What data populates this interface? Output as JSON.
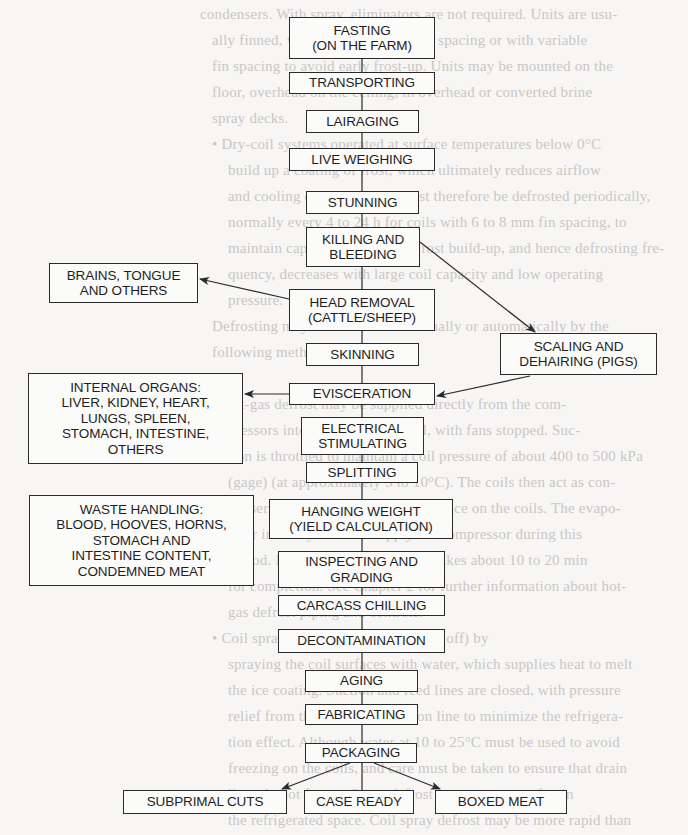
{
  "background_text": {
    "color": "#c9c7c4",
    "lines": [
      {
        "x": 200,
        "y": 6,
        "text": "condensers. With spray, eliminators are not required. Units are usu-"
      },
      {
        "x": 212,
        "y": 32,
        "text": "ally finned, with fins at about 6 mm spacing or with variable"
      },
      {
        "x": 212,
        "y": 58,
        "text": "fin spacing to avoid early frost-up. Units may be mounted on the"
      },
      {
        "x": 212,
        "y": 84,
        "text": "floor, overhead on the ceiling, in overhead or converted brine"
      },
      {
        "x": 212,
        "y": 110,
        "text": "spray decks."
      },
      {
        "x": 212,
        "y": 136,
        "text": "• Dry-coil systems operated at surface temperatures below 0°C"
      },
      {
        "x": 228,
        "y": 162,
        "text": "build up a coating of frost, which ultimately reduces airflow"
      },
      {
        "x": 228,
        "y": 188,
        "text": "and cooling capacity. Coils must therefore be defrosted periodically,"
      },
      {
        "x": 228,
        "y": 214,
        "text": "normally every 4 to 24 h for coils with 6 to 8 mm fin spacing, to"
      },
      {
        "x": 228,
        "y": 240,
        "text": "maintain capacity. The rate of frost build-up, and hence defrosting fre-"
      },
      {
        "x": 228,
        "y": 266,
        "text": "quency, decreases with large coil capacity and low operating"
      },
      {
        "x": 228,
        "y": 292,
        "text": "pressure."
      },
      {
        "x": 212,
        "y": 318,
        "text": "Defrosting may be done either manually or automatically by the"
      },
      {
        "x": 212,
        "y": 344,
        "text": "following methods:"
      },
      {
        "x": 212,
        "y": 396,
        "text": "• Hot-gas defrost may be supplied directly from the com-"
      },
      {
        "x": 228,
        "y": 422,
        "text": "pressors into the evaporator coil, with fans stopped. Suc-"
      },
      {
        "x": 228,
        "y": 448,
        "text": "tion is throttled to maintain a coil pressure of about 400 to 500 kPa"
      },
      {
        "x": 228,
        "y": 474,
        "text": "(gage) (at approximately 5 to 10°C). The coils then act as con-"
      },
      {
        "x": 228,
        "y": 500,
        "text": "densers and supply heat to melt the ice on the coils. The evapo-"
      },
      {
        "x": 228,
        "y": 526,
        "text": "rator in the system can supply the compressor during this"
      },
      {
        "x": 228,
        "y": 552,
        "text": "period. Hot-gas defrost normally takes about 10 to 20 min"
      },
      {
        "x": 228,
        "y": 578,
        "text": "for completion. See Chapter 2 for further information about hot-"
      },
      {
        "x": 228,
        "y": 604,
        "text": "gas defrost piping and controls."
      },
      {
        "x": 212,
        "y": 630,
        "text": "• Coil spray defrost (with fans turned off) by"
      },
      {
        "x": 228,
        "y": 656,
        "text": "spraying the coil surfaces with water, which supplies heat to melt"
      },
      {
        "x": 228,
        "y": 682,
        "text": "the ice coating. Suction and feed lines are closed, with pressure"
      },
      {
        "x": 228,
        "y": 708,
        "text": "relief from the coil to the suction line to minimize the refrigera-"
      },
      {
        "x": 228,
        "y": 734,
        "text": "tion effect. Although water at 10 to 25°C must be used to avoid"
      },
      {
        "x": 228,
        "y": 760,
        "text": "freezing on the coils, and care must be taken to ensure that drain"
      },
      {
        "x": 228,
        "y": 786,
        "text": "lines do not freeze. Spray defrost can cause some fog in"
      },
      {
        "x": 228,
        "y": 812,
        "text": "the refrigerated space. Coil spray defrost may be more rapid than"
      }
    ]
  },
  "diagram": {
    "stroke_color": "#2a2a2a",
    "main_steps": [
      {
        "id": "fasting",
        "lines": [
          "FASTING",
          "(ON THE FARM)"
        ],
        "x": 289,
        "y": 17,
        "w": 146,
        "h": 42
      },
      {
        "id": "transporting",
        "lines": [
          "TRANSPORTING"
        ],
        "x": 289,
        "y": 72,
        "w": 146,
        "h": 22
      },
      {
        "id": "lairaging",
        "lines": [
          "LAIRAGING"
        ],
        "x": 306,
        "y": 110,
        "w": 113,
        "h": 23
      },
      {
        "id": "live-weighing",
        "lines": [
          "LIVE WEIGHING"
        ],
        "x": 289,
        "y": 148,
        "w": 146,
        "h": 23
      },
      {
        "id": "stunning",
        "lines": [
          "STUNNING"
        ],
        "x": 306,
        "y": 191,
        "w": 113,
        "h": 23
      },
      {
        "id": "killing-bleeding",
        "lines": [
          "KILLING AND",
          "BLEEDING"
        ],
        "x": 306,
        "y": 227,
        "w": 114,
        "h": 40
      },
      {
        "id": "head-removal",
        "lines": [
          "HEAD REMOVAL",
          "(CATTLE/SHEEP)"
        ],
        "x": 289,
        "y": 289,
        "w": 146,
        "h": 42
      },
      {
        "id": "skinning",
        "lines": [
          "SKINNING"
        ],
        "x": 306,
        "y": 343,
        "w": 113,
        "h": 23
      },
      {
        "id": "evisceration",
        "lines": [
          "EVISCERATION"
        ],
        "x": 289,
        "y": 383,
        "w": 146,
        "h": 22
      },
      {
        "id": "electrical-stimulating",
        "lines": [
          "ELECTRICAL",
          "STIMULATING"
        ],
        "x": 301,
        "y": 417,
        "w": 123,
        "h": 38
      },
      {
        "id": "splitting",
        "lines": [
          "SPLITTING"
        ],
        "x": 306,
        "y": 462,
        "w": 112,
        "h": 21
      },
      {
        "id": "hanging-weight",
        "lines": [
          "HANGING WEIGHT",
          "(YIELD CALCULATION)"
        ],
        "x": 269,
        "y": 499,
        "w": 184,
        "h": 40
      },
      {
        "id": "inspecting-grading",
        "lines": [
          "INSPECTING AND",
          "GRADING"
        ],
        "x": 278,
        "y": 551,
        "w": 167,
        "h": 37
      },
      {
        "id": "carcass-chilling",
        "lines": [
          "CARCASS CHILLING"
        ],
        "x": 278,
        "y": 595,
        "w": 167,
        "h": 21
      },
      {
        "id": "decontamination",
        "lines": [
          "DECONTAMINATION"
        ],
        "x": 278,
        "y": 629,
        "w": 167,
        "h": 24
      },
      {
        "id": "aging",
        "lines": [
          "AGING"
        ],
        "x": 305,
        "y": 670,
        "w": 113,
        "h": 22
      },
      {
        "id": "fabricating",
        "lines": [
          "FABRICATING"
        ],
        "x": 305,
        "y": 704,
        "w": 113,
        "h": 21
      },
      {
        "id": "packaging",
        "lines": [
          "PACKAGING"
        ],
        "x": 305,
        "y": 743,
        "w": 112,
        "h": 20
      }
    ],
    "side_boxes": [
      {
        "id": "brains-tongue",
        "lines": [
          "BRAINS, TONGUE",
          "AND OTHERS"
        ],
        "x": 49,
        "y": 263,
        "w": 149,
        "h": 40
      },
      {
        "id": "scaling-dehairing",
        "lines": [
          "SCALING AND",
          "DEHAIRING (PIGS)"
        ],
        "x": 500,
        "y": 333,
        "w": 157,
        "h": 42
      },
      {
        "id": "internal-organs",
        "lines": [
          "INTERNAL ORGANS:",
          "LIVER, KIDNEY, HEART,",
          "LUNGS, SPLEEN,",
          "STOMACH, INTESTINE,",
          "OTHERS"
        ],
        "x": 28,
        "y": 373,
        "w": 215,
        "h": 91
      },
      {
        "id": "waste-handling",
        "lines": [
          "WASTE HANDLING:",
          "BLOOD, HOOVES, HORNS,",
          "STOMACH AND",
          "INTESTINE CONTENT,",
          "CONDEMNED MEAT"
        ],
        "x": 29,
        "y": 495,
        "w": 225,
        "h": 91
      }
    ],
    "outputs": [
      {
        "id": "subprimal-cuts",
        "lines": [
          "SUBPRIMAL CUTS"
        ],
        "x": 123,
        "y": 790,
        "w": 164,
        "h": 24
      },
      {
        "id": "case-ready",
        "lines": [
          "CASE READY"
        ],
        "x": 304,
        "y": 790,
        "w": 110,
        "h": 24
      },
      {
        "id": "boxed-meat",
        "lines": [
          "BOXED MEAT"
        ],
        "x": 435,
        "y": 790,
        "w": 132,
        "h": 24
      }
    ],
    "spine_x": 362,
    "spine_segments": [
      [
        59,
        72
      ],
      [
        94,
        110
      ],
      [
        133,
        148
      ],
      [
        171,
        191
      ],
      [
        214,
        227
      ],
      [
        267,
        289
      ],
      [
        331,
        343
      ],
      [
        366,
        383
      ],
      [
        405,
        417
      ],
      [
        455,
        462
      ],
      [
        483,
        499
      ],
      [
        539,
        551
      ],
      [
        588,
        595
      ],
      [
        616,
        629
      ],
      [
        653,
        670
      ],
      [
        692,
        704
      ],
      [
        725,
        743
      ],
      [
        763,
        790
      ]
    ],
    "arrows": [
      {
        "from": [
          289,
          299
        ],
        "to": [
          200,
          279
        ],
        "label": "head-removal-to-brains"
      },
      {
        "from": [
          420,
          242
        ],
        "to": [
          535,
          332
        ],
        "label": "killing-to-scaling"
      },
      {
        "from": [
          530,
          376
        ],
        "to": [
          437,
          396
        ],
        "label": "scaling-to-evisceration"
      },
      {
        "from": [
          289,
          394
        ],
        "to": [
          245,
          394
        ],
        "label": "evisceration-to-internal-organs"
      },
      {
        "from": [
          350,
          763
        ],
        "to": [
          282,
          789
        ],
        "label": "packaging-to-subprimal"
      },
      {
        "from": [
          374,
          763
        ],
        "to": [
          440,
          789
        ],
        "label": "packaging-to-boxed-meat"
      }
    ]
  }
}
